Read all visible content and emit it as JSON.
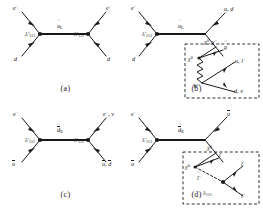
{
  "figure": {
    "type": "feynman-diagram-grid",
    "rows": 2,
    "cols": 2,
    "line_color": "#1a1a1a",
    "vertex_color": "#1a1a1a",
    "box_style": "dashed"
  },
  "panels": [
    {
      "id": "a",
      "caption": "(a)",
      "propagator": {
        "symbol": "u",
        "tilde": true,
        "sub": "L",
        "bar": false
      },
      "vertices": [
        {
          "name": "lambda-left",
          "label": "λ'",
          "sub": "111"
        },
        {
          "name": "lambda-right",
          "label": "λ'",
          "sub": "111"
        }
      ],
      "legs": [
        {
          "name": "incoming-positron",
          "label": "e",
          "sup": "+",
          "bar": false
        },
        {
          "name": "incoming-dquark",
          "label": "d",
          "sup": "",
          "bar": false
        },
        {
          "name": "outgoing-positron",
          "label": "e",
          "sup": "+",
          "bar": false
        },
        {
          "name": "outgoing-dquark",
          "label": "d",
          "sup": "",
          "bar": false
        }
      ]
    },
    {
      "id": "b",
      "caption": "(b)",
      "propagator": {
        "symbol": "u",
        "tilde": true,
        "sub": "L",
        "bar": false
      },
      "vertices": [
        {
          "name": "lambda-left",
          "label": "λ'",
          "sub": "111"
        }
      ],
      "legs": [
        {
          "name": "incoming-positron",
          "label": "e",
          "sup": "+",
          "bar": false
        },
        {
          "name": "incoming-dquark",
          "label": "d",
          "sup": "",
          "bar": false
        },
        {
          "name": "outgoing-quarks",
          "label": "u, d",
          "sup": "",
          "bar": false
        },
        {
          "name": "gaugino-propagator",
          "label": "χ⁰, χ⁻",
          "sup": "",
          "bar": false
        }
      ],
      "box": {
        "name": "cascade-decay-box",
        "internal": [
          {
            "name": "chi-label",
            "label": "χ⁰"
          },
          {
            "name": "gluino-label",
            "label": "g",
            "tilde": true,
            "sup": ""
          },
          {
            "name": "w-boson",
            "label": "W",
            "sup": "±",
            "wavy": true
          },
          {
            "name": "quark-pair-upper",
            "label": "u, l",
            "sup": "+"
          },
          {
            "name": "quark-pair-lower",
            "label": "d, ν",
            "sup": ""
          }
        ]
      }
    },
    {
      "id": "c",
      "caption": "(c)",
      "propagator": {
        "symbol": "d",
        "tilde": true,
        "sub": "R",
        "bar": true
      },
      "vertices": [
        {
          "name": "lambda-left",
          "label": "λ'",
          "sub": "111"
        },
        {
          "name": "lambda-right",
          "label": "λ'",
          "sub": "111"
        }
      ],
      "legs": [
        {
          "name": "incoming-positron",
          "label": "e",
          "sup": "+",
          "bar": false
        },
        {
          "name": "incoming-antiup",
          "label": "u",
          "sup": "",
          "bar": true
        },
        {
          "name": "outgoing-leptons",
          "label": "e, ν",
          "sup": "+",
          "bar": false
        },
        {
          "name": "outgoing-antiquarks",
          "label": "u, d",
          "sup": "",
          "bar": true
        }
      ]
    },
    {
      "id": "d",
      "caption": "(d)",
      "propagator": {
        "symbol": "d",
        "tilde": true,
        "sub": "R",
        "bar": true
      },
      "vertices": [
        {
          "name": "lambda-left",
          "label": "λ'",
          "sub": "111"
        }
      ],
      "legs": [
        {
          "name": "incoming-positron",
          "label": "e",
          "sup": "+",
          "bar": false
        },
        {
          "name": "incoming-antiup",
          "label": "u",
          "sup": "",
          "bar": true
        },
        {
          "name": "outgoing-antiup-upper",
          "label": "u",
          "sup": "",
          "bar": true
        },
        {
          "name": "chi-propagator",
          "label": "χ⁰",
          "sup": ""
        }
      ],
      "box": {
        "name": "cascade-decay-box",
        "internal": [
          {
            "name": "chi-label",
            "label": "χ⁰"
          },
          {
            "name": "lepton-upper",
            "label": "l",
            "sup": "+"
          },
          {
            "name": "slepton-label",
            "label": "l",
            "tilde": true,
            "sup": "−",
            "dashed": true
          },
          {
            "name": "lambda-vertex",
            "label": "λ",
            "sub": "111"
          },
          {
            "name": "lepton-out-upper",
            "label": "l",
            "sup": "+"
          },
          {
            "name": "lepton-out-lower",
            "label": "l",
            "sup": "−"
          }
        ]
      }
    }
  ]
}
